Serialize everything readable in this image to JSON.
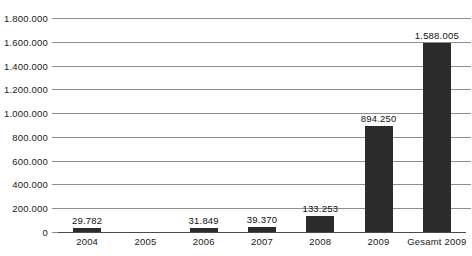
{
  "chart_data": {
    "type": "bar",
    "title": "",
    "subtitle": "",
    "xlabel": "",
    "ylabel": "",
    "categories": [
      "2004",
      "2005",
      "2006",
      "2007",
      "2008",
      "2009",
      "Gesamt 2009"
    ],
    "values": [
      29782,
      null,
      31849,
      39370,
      133253,
      894250,
      1588005
    ],
    "value_labels": [
      "29.782",
      "",
      "31.849",
      "39.370",
      "133.253",
      "894.250",
      "1.588.005"
    ],
    "ylim": [
      0,
      1800000
    ],
    "ytick_values": [
      0,
      200000,
      400000,
      600000,
      800000,
      1000000,
      1200000,
      1400000,
      1600000,
      1800000
    ],
    "ytick_labels": [
      "0",
      "200.000",
      "400.000",
      "600.000",
      "800.000",
      "1.000.000",
      "1.200.000",
      "1.400.000",
      "1.600.000",
      "1.800.000"
    ],
    "grid": "horizontal",
    "legend": "none",
    "bar_color": "#2b2b2b",
    "gridline_color": "#8e8e8e",
    "axis_color": "#4a4a4a",
    "background_color": "#ffffff"
  }
}
